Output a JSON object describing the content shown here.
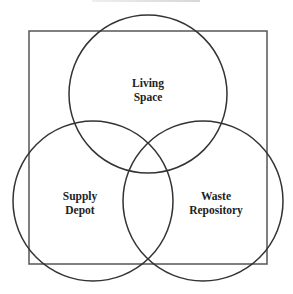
{
  "diagram": {
    "type": "venn",
    "title_visible": false,
    "frame": {
      "x": 29,
      "y": 31,
      "width": 238,
      "height": 233,
      "stroke": "#555555"
    },
    "stroke_color": "#333333",
    "circles": [
      {
        "id": "living-space",
        "cx": 148,
        "cy": 94,
        "r": 79,
        "label_lines": [
          "Living",
          "Space"
        ],
        "label_x": 148,
        "label_y": [
          87,
          101
        ]
      },
      {
        "id": "supply-depot",
        "cx": 93,
        "cy": 201,
        "r": 80,
        "label_lines": [
          "Supply",
          "Depot"
        ],
        "label_x": 80,
        "label_y": [
          200,
          214
        ]
      },
      {
        "id": "waste-repository",
        "cx": 203,
        "cy": 201,
        "r": 80,
        "label_lines": [
          "Waste",
          "Repository"
        ],
        "label_x": 216,
        "label_y": [
          200,
          214
        ]
      }
    ]
  },
  "labels": {
    "living_1": "Living",
    "living_2": "Space",
    "supply_1": "Supply",
    "supply_2": "Depot",
    "waste_1": "Waste",
    "waste_2": "Repository"
  }
}
